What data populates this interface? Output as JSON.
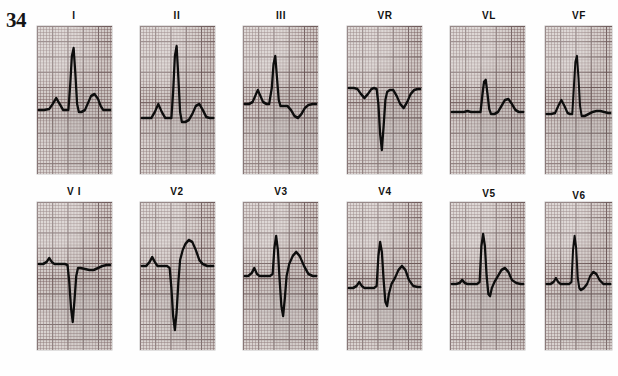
{
  "figure": {
    "number": "34",
    "caption_present": false
  },
  "layout": {
    "rows": 2,
    "columns": 6,
    "strip_width": 75,
    "strip_height": 148,
    "row1_label_y": 10,
    "row1_strip_y": 26,
    "row2_label_y": 186,
    "row2_strip_y": 202,
    "column_x": [
      37,
      140,
      243,
      347,
      450,
      545
    ]
  },
  "style": {
    "paper_color": "#d2cac7",
    "minor_grid_color": "#786060",
    "major_grid_color": "#463434",
    "trace_color": "#0d0d0d",
    "page_background": "#fefefe"
  },
  "chart_data": {
    "type": "line",
    "title": "34",
    "xlabel": "",
    "ylabel": "",
    "grid": true,
    "legend": "none",
    "series": [
      {
        "name": "I",
        "row": 1,
        "column": 1,
        "features": "small upright P wave, tall narrow R wave, broad upright T wave",
        "points": "2,84 8,84 14,83 18,78 22,72 26,78 30,84 33,84 36,84 38,60 40,30 42,22 44,48 46,78 48,86 51,86 55,84 58,78 62,70 66,68 70,73 73,80 76,84 80,84 84,84"
      },
      {
        "name": "II",
        "row": 1,
        "column": 2,
        "features": "prominent P wave, tall narrow R wave, upright T wave",
        "points": "2,92 8,92 13,92 17,86 21,78 25,86 29,92 33,92 36,92 38,66 40,30 42,20 44,52 46,86 48,96 52,96 56,94 60,88 64,80 68,78 72,84 76,91 80,92 84,92"
      },
      {
        "name": "III",
        "row": 1,
        "column": 3,
        "features": "small notched P wave, small R wave, inverted T wave",
        "points": "2,78 7,78 11,76 14,70 17,64 20,70 23,76 27,78 30,78 33,62 35,38 37,30 39,52 41,74 43,80 47,80 51,80 55,84 59,90 63,92 67,88 71,82 75,79 80,78 84,78"
      },
      {
        "name": "VR",
        "row": 1,
        "column": 4,
        "features": "negative P wave, deep QS complex, inverted T wave",
        "points": "2,62 8,62 12,63 16,68 20,72 24,68 28,63 31,62 34,63 36,78 38,108 40,124 42,100 44,74 46,66 49,64 53,64 57,70 61,78 65,82 69,76 73,68 77,64 81,63 84,63"
      },
      {
        "name": "VL",
        "row": 1,
        "column": 5,
        "features": "low flat baseline, small R wave, low amplitude upright T wave",
        "points": "2,86 10,86 16,86 20,85 24,86 28,86 32,86 35,86 37,70 39,56 41,54 43,68 45,83 47,88 51,88 55,86 59,80 63,74 67,73 71,78 75,84 79,86 84,86"
      },
      {
        "name": "VF",
        "row": 1,
        "column": 6,
        "features": "upright P wave, tall R wave, flat to low T wave",
        "points": "2,88 8,88 13,87 17,80 21,74 25,80 29,87 32,88 35,88 37,62 39,36 41,30 43,52 45,80 47,90 51,90 56,88 61,86 66,85 71,85 76,86 81,87 84,87"
      },
      {
        "name": "V1",
        "row": 2,
        "column": 1,
        "features": "rS complex with deep narrow S wave, flat to slightly inverted T wave",
        "points": "2,62 7,62 11,60 14,56 17,60 20,62 24,62 28,62 32,62 35,63 37,80 39,106 41,120 43,98 45,74 47,66 50,66 55,67 60,68 65,68 70,66 75,64 80,63 84,63"
      },
      {
        "name": "V2",
        "row": 2,
        "column": 2,
        "features": "rS complex with very deep S wave, elevated ST segment and tall upright T wave",
        "points": "2,64 7,64 11,60 14,55 17,60 20,64 24,64 28,64 31,64 34,66 36,86 38,114 40,128 42,110 44,80 46,58 49,48 52,42 56,38 60,40 64,48 68,58 72,62 77,64 82,64 84,64"
      },
      {
        "name": "V3",
        "row": 2,
        "column": 3,
        "features": "RS complex, deep S wave, large upright T wave",
        "points": "2,74 6,74 10,71 13,66 16,72 19,74 23,74 27,74 31,74 34,72 36,46 38,34 40,48 42,78 44,104 46,114 48,96 50,74 53,62 57,54 61,50 65,54 70,64 75,72 80,74 84,74"
      },
      {
        "name": "V4",
        "row": 2,
        "column": 4,
        "features": "tall R wave with S wave, upright T wave",
        "points": "2,86 7,86 11,84 14,80 17,84 20,86 24,86 28,86 31,86 34,84 36,54 38,40 40,50 42,78 44,100 46,104 48,92 51,82 55,76 59,68 63,64 67,68 71,78 76,84 81,85 84,85"
      },
      {
        "name": "V5",
        "row": 2,
        "column": 5,
        "features": "tall R wave, small S wave, upright T wave",
        "points": "2,82 7,82 11,81 14,78 17,81 20,82 24,82 28,82 31,82 34,80 36,44 38,32 40,44 42,74 44,92 46,94 48,86 51,80 55,74 59,68 63,66 67,70 71,78 76,81 81,82 84,82"
      },
      {
        "name": "V6",
        "row": 2,
        "column": 6,
        "features": "tall narrow R wave, upright T wave",
        "points": "2,82 7,82 11,80 14,76 17,80 20,82 24,82 28,82 31,82 34,80 36,48 38,34 40,46 42,76 44,86 46,88 50,86 54,82 58,74 62,70 66,72 70,78 75,82 80,82 84,82"
      }
    ]
  },
  "leads": {
    "row1": [
      {
        "label": "I"
      },
      {
        "label": "II"
      },
      {
        "label": "III"
      },
      {
        "label": "VR"
      },
      {
        "label": "VL"
      },
      {
        "label": "VF"
      }
    ],
    "row2": [
      {
        "label": "V I"
      },
      {
        "label": "V2"
      },
      {
        "label": "V3"
      },
      {
        "label": "V4"
      },
      {
        "label": "V5"
      },
      {
        "label": "V6"
      }
    ]
  }
}
